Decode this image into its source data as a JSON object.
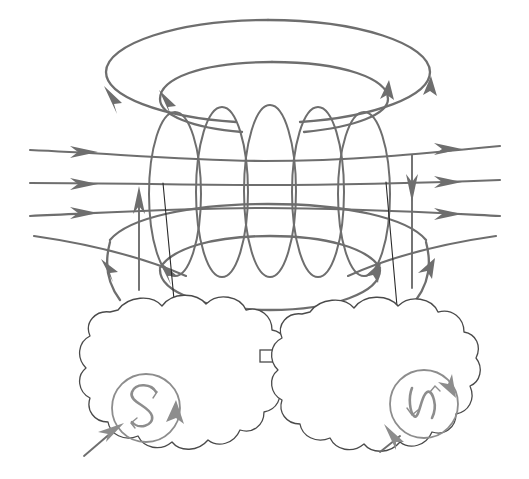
{
  "figure": {
    "title": "Toroidal magnetic field linking two polar source regions",
    "domain": "diagram",
    "background_color": "#ffffff",
    "width": 529,
    "height": 479,
    "line_color": "#6e6e6e",
    "outline_color": "#4a4a4a",
    "glyph_color": "#8d8d8d",
    "lead_color": "#2b2b2b"
  },
  "labels": {
    "south_pole": "S",
    "north_pole": "N"
  },
  "regions": {
    "left_cloud": {
      "name": "left-cloud-region",
      "pole_label": "S",
      "center_x": 135,
      "center_y": 400,
      "circulation": "clockwise"
    },
    "right_cloud": {
      "name": "right-cloud-region",
      "pole_label": "N",
      "center_x": 430,
      "center_y": 400,
      "circulation": "counterclockwise"
    }
  },
  "structures": {
    "outer_torus_ring": {
      "name": "outer-toroidal-ring",
      "cx": 268,
      "cy": 72,
      "rx": 162,
      "ry": 52,
      "arrow_count": 2,
      "direction": "left-arrow-down, right-arrow-up"
    },
    "inner_torus_ring": {
      "name": "inner-toroidal-ring",
      "cx": 272,
      "cy": 98,
      "rx": 110,
      "ry": 38,
      "arrow_count": 2,
      "direction": "left-arrow-down, right-arrow-up"
    },
    "lower_outer_ring": {
      "name": "lower-outer-ring",
      "cx": 268,
      "cy": 245,
      "rx": 162,
      "ry": 52
    },
    "lower_inner_ring": {
      "name": "lower-inner-ring",
      "cx": 270,
      "cy": 272,
      "rx": 112,
      "ry": 38
    },
    "coil": {
      "name": "solenoid-coil",
      "loop_count": 5,
      "loop_centers_x": [
        175,
        222,
        270,
        318,
        364
      ],
      "loop_cy": 192,
      "loop_rx": 26,
      "loop_ry": 82
    },
    "horizontal_field_lines": {
      "name": "horizontal-field-lines",
      "count": 3,
      "y_positions": [
        155,
        185,
        215
      ],
      "left_arrow": "right-pointing",
      "right_arrow": "right-pointing"
    },
    "lead_wires": {
      "name": "current-lead-wires",
      "count": 2,
      "left_x_top": 163,
      "left_x_bottom": 178,
      "right_x_top": 386,
      "right_x_bottom": 400
    }
  },
  "annotations": {
    "current_up_arrow": "left vertical gray arrow pointing up",
    "current_down_arrow": "right vertical gray arrow pointing down",
    "inflow_arrow_left": "gray arrow into left cloud",
    "inflow_arrow_right": "gray arrow into right cloud"
  }
}
